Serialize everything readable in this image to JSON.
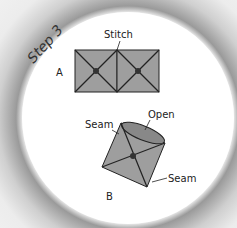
{
  "step_title": "Step 3",
  "figure_a": {
    "label": "A",
    "callout": "Stitch"
  },
  "figure_b": {
    "label": "B",
    "callouts": {
      "seam_left": "Seam",
      "open": "Open",
      "seam_right": "Seam"
    }
  },
  "colors": {
    "panel_fill": "#9e9e9e",
    "stroke": "#222222",
    "background_ring": "#9a9a9a"
  }
}
